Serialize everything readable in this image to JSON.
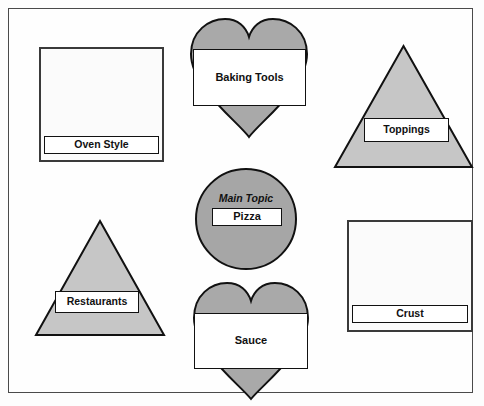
{
  "diagram": {
    "type": "concept-map",
    "center": {
      "shape": "circle",
      "caption": "Main Topic",
      "label": "Pizza",
      "fill": "#a6a6a6",
      "stroke": "#111111"
    },
    "nodes": [
      {
        "id": "oven-style",
        "label": "Oven Style",
        "shape": "square",
        "fill": "#fbfbfb",
        "stroke": "#3a3a3a",
        "position": "top-left"
      },
      {
        "id": "baking-tools",
        "label": "Baking Tools",
        "shape": "heart",
        "fill": "#a9a9a9",
        "stroke": "#111111",
        "position": "top-center"
      },
      {
        "id": "toppings",
        "label": "Toppings",
        "shape": "triangle",
        "fill": "#c6c6c6",
        "stroke": "#111111",
        "position": "top-right"
      },
      {
        "id": "restaurants",
        "label": "Restaurants",
        "shape": "triangle",
        "fill": "#c6c6c6",
        "stroke": "#111111",
        "position": "bottom-left"
      },
      {
        "id": "sauce",
        "label": "Sauce",
        "shape": "heart",
        "fill": "#a9a9a9",
        "stroke": "#111111",
        "position": "bottom-center"
      },
      {
        "id": "crust",
        "label": "Crust",
        "shape": "square",
        "fill": "#fbfbfb",
        "stroke": "#3a3a3a",
        "position": "bottom-right"
      }
    ],
    "frame": {
      "stroke": "#4a4a4a",
      "background": "#fefefe"
    }
  }
}
